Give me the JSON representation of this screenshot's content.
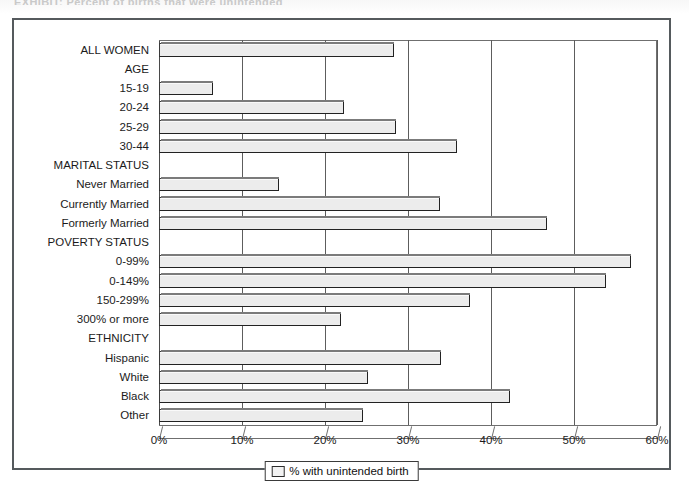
{
  "page": {
    "top_caption": "EXHIBIT: Percent of births that were unintended"
  },
  "chart_data": {
    "type": "bar",
    "orientation": "horizontal",
    "title": "",
    "xlabel": "",
    "ylabel": "",
    "xlim": [
      0,
      60
    ],
    "xticks": [
      "0%",
      "10%",
      "20%",
      "30%",
      "40%",
      "50%",
      "60%"
    ],
    "xtick_values": [
      0,
      10,
      20,
      30,
      40,
      50,
      60
    ],
    "grid": true,
    "legend_position": "bottom",
    "legend": [
      "% with unintended birth"
    ],
    "series_name": "% with unintended birth",
    "bar_fill": "#ececec",
    "bar_border": "#333333",
    "categories": [
      {
        "label": "ALL WOMEN",
        "value": 28.3,
        "is_header": false
      },
      {
        "label": "AGE",
        "value": null,
        "is_header": true
      },
      {
        "label": "15-19",
        "value": 6.5,
        "is_header": false
      },
      {
        "label": "20-24",
        "value": 22.3,
        "is_header": false
      },
      {
        "label": "25-29",
        "value": 28.5,
        "is_header": false
      },
      {
        "label": "30-44",
        "value": 35.9,
        "is_header": false
      },
      {
        "label": "MARITAL STATUS",
        "value": null,
        "is_header": true
      },
      {
        "label": "Never Married",
        "value": 14.5,
        "is_header": false
      },
      {
        "label": "Currently Married",
        "value": 33.8,
        "is_header": false
      },
      {
        "label": "Formerly Married",
        "value": 46.8,
        "is_header": false
      },
      {
        "label": "POVERTY STATUS",
        "value": null,
        "is_header": true
      },
      {
        "label": "0-99%",
        "value": 56.9,
        "is_header": false
      },
      {
        "label": "0-149%",
        "value": 53.8,
        "is_header": false
      },
      {
        "label": "150-299%",
        "value": 37.5,
        "is_header": false
      },
      {
        "label": "300% or more",
        "value": 21.9,
        "is_header": false
      },
      {
        "label": "ETHNICITY",
        "value": null,
        "is_header": true
      },
      {
        "label": "Hispanic",
        "value": 34.0,
        "is_header": false
      },
      {
        "label": "White",
        "value": 25.2,
        "is_header": false
      },
      {
        "label": "Black",
        "value": 42.3,
        "is_header": false
      },
      {
        "label": "Other",
        "value": 24.6,
        "is_header": false
      }
    ]
  }
}
